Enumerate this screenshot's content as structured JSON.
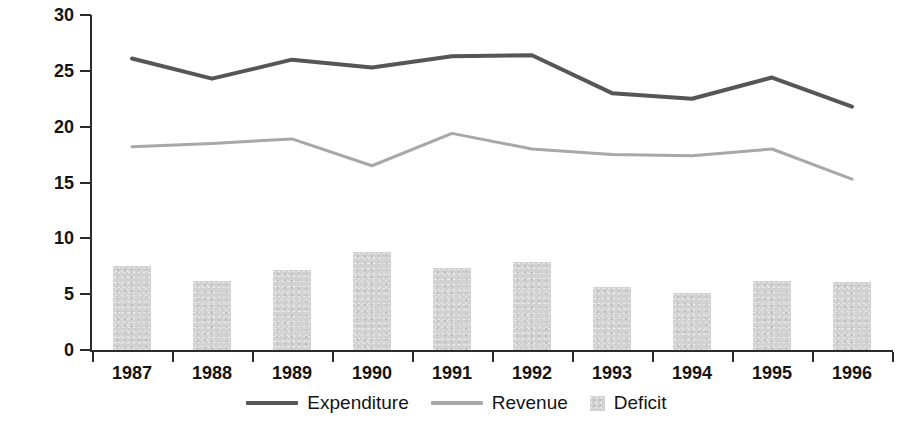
{
  "chart_data": {
    "type": "line",
    "title": "",
    "xlabel": "",
    "ylabel": "% of GDP",
    "ylim": [
      0,
      30
    ],
    "yticks": [
      0,
      5,
      10,
      15,
      20,
      25,
      30
    ],
    "grid": false,
    "legend_position": "bottom",
    "categories": [
      "1987",
      "1988",
      "1989",
      "1990",
      "1991",
      "1992",
      "1993",
      "1994",
      "1995",
      "1996"
    ],
    "series": [
      {
        "name": "Expenditure",
        "type": "line",
        "color": "#565656",
        "values": [
          26.1,
          24.3,
          26.0,
          25.3,
          26.3,
          26.4,
          23.0,
          22.5,
          24.4,
          21.8
        ]
      },
      {
        "name": "Revenue",
        "type": "line",
        "color": "#a8a8a8",
        "values": [
          18.2,
          18.5,
          18.9,
          16.5,
          19.4,
          18.0,
          17.5,
          17.4,
          18.0,
          15.3
        ]
      },
      {
        "name": "Deficit",
        "type": "bar",
        "color": "#d2d2d2",
        "values": [
          7.5,
          6.2,
          7.2,
          8.8,
          7.3,
          7.9,
          5.6,
          5.1,
          6.2,
          6.1
        ]
      }
    ]
  },
  "axes": {
    "y_title": "% of GDP",
    "y_tick_labels": [
      "0",
      "5",
      "10",
      "15",
      "20",
      "25",
      "30"
    ],
    "x_tick_labels": [
      "1987",
      "1988",
      "1989",
      "1990",
      "1991",
      "1992",
      "1993",
      "1994",
      "1995",
      "1996"
    ]
  },
  "legend": {
    "items": [
      {
        "label": "Expenditure",
        "marker": "line",
        "color": "#565656"
      },
      {
        "label": "Revenue",
        "marker": "line",
        "color": "#a8a8a8"
      },
      {
        "label": "Deficit",
        "marker": "swatch",
        "color": "#d2d2d2"
      }
    ]
  }
}
